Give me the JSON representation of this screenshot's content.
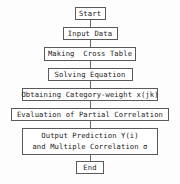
{
  "diagram": {
    "type": "flowchart",
    "orientation": "vertical",
    "background_color": "#fdfdfd",
    "border_color": "#5a5a5a",
    "text_color": "#1a1a1a",
    "connector_color": "#6b6b6b",
    "nodes": [
      {
        "id": "start",
        "shape": "rectangle",
        "label": "Start"
      },
      {
        "id": "input-data",
        "shape": "rectangle",
        "label": "Input Data"
      },
      {
        "id": "making-cross-table",
        "shape": "rectangle",
        "label": "Making  Cross Table"
      },
      {
        "id": "solving-equation",
        "shape": "rectangle",
        "label": "Solving Equation"
      },
      {
        "id": "obtaining-category-weight",
        "shape": "rectangle",
        "label": "Obtaining Category-weight x(jk)"
      },
      {
        "id": "evaluation-partial-correlation",
        "shape": "rectangle",
        "label": "Evaluation of Partial Correlation"
      },
      {
        "id": "output-prediction",
        "shape": "rectangle",
        "label_line1": "Output Prediction Y(i)",
        "label_line2": "and Multiple Correlation σ"
      },
      {
        "id": "end",
        "shape": "rectangle",
        "label": "End"
      }
    ],
    "edges": [
      {
        "from": "start",
        "to": "input-data"
      },
      {
        "from": "input-data",
        "to": "making-cross-table"
      },
      {
        "from": "making-cross-table",
        "to": "solving-equation"
      },
      {
        "from": "solving-equation",
        "to": "obtaining-category-weight"
      },
      {
        "from": "obtaining-category-weight",
        "to": "evaluation-partial-correlation"
      },
      {
        "from": "evaluation-partial-correlation",
        "to": "output-prediction"
      },
      {
        "from": "output-prediction",
        "to": "end"
      }
    ]
  }
}
